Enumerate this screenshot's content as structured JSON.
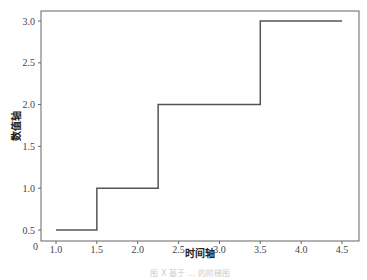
{
  "chart_data": {
    "type": "line",
    "style": "step",
    "title": "",
    "xlabel": "时间轴",
    "ylabel": "数值轴",
    "x": [
      1.0,
      1.5,
      1.5,
      2.25,
      2.25,
      3.5,
      3.5,
      4.5
    ],
    "y": [
      0.5,
      0.5,
      1.0,
      1.0,
      2.0,
      2.0,
      3.0,
      3.0
    ],
    "series": [
      {
        "name": "step",
        "x": [
          1.0,
          1.5,
          2.25,
          3.5,
          4.5
        ],
        "values": [
          0.5,
          1.0,
          2.0,
          3.0,
          3.0
        ],
        "color": "#555555"
      }
    ],
    "xticks": [
      "1.0",
      "1.5",
      "2.0",
      "2.5",
      "3.0",
      "3.5",
      "4.0",
      "4.5"
    ],
    "yticks": [
      "0.5",
      "1.0",
      "1.5",
      "2.0",
      "2.5",
      "3.0"
    ],
    "corner_label": "0",
    "xlim": [
      0.87,
      4.6
    ],
    "ylim": [
      0.42,
      3.08
    ],
    "grid": false,
    "legend": null
  },
  "caption": "图 X 基于 ... 的阶梯图"
}
